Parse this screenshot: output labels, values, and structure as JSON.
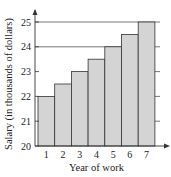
{
  "chart_data": {
    "type": "bar",
    "title": "",
    "xlabel": "Year of work",
    "ylabel": "Salary (in thousands of dollars)",
    "categories": [
      "1",
      "2",
      "3",
      "4",
      "5",
      "6",
      "7"
    ],
    "values": [
      22,
      22.5,
      23,
      23.5,
      24,
      24.5,
      25
    ],
    "ylim": [
      20,
      25
    ],
    "yticks": [
      "20",
      "21",
      "22",
      "23",
      "24",
      "25"
    ],
    "grid": "horizontal lines at 24 and 25 across plot; right-side ticks",
    "bar_color": "#d4d4d4",
    "edge_color": "#333333"
  }
}
